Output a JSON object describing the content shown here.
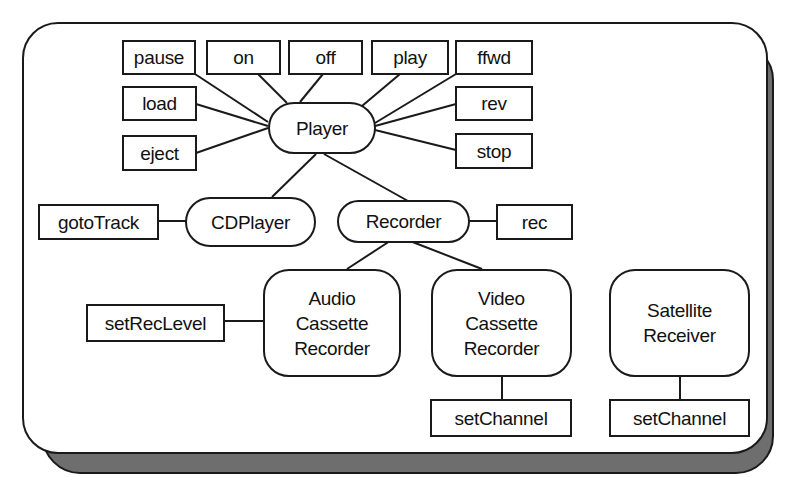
{
  "diagram": {
    "type": "class-hierarchy",
    "colors": {
      "stroke": "#1a1a1a",
      "shadow": "#6e6e6e",
      "background": "#ffffff"
    },
    "classes": {
      "player": "Player",
      "cdplayer": "CDPlayer",
      "recorder": "Recorder",
      "audio_cassette": "Audio\nCassette\nRecorder",
      "video_cassette": "Video\nCassette\nRecorder",
      "satellite": "Satellite\nReceiver"
    },
    "methods": {
      "pause": "pause",
      "on": "on",
      "off": "off",
      "play": "play",
      "ffwd": "ffwd",
      "load": "load",
      "rev": "rev",
      "eject": "eject",
      "stop": "stop",
      "gototrack": "gotoTrack",
      "rec": "rec",
      "setreclevel": "setRecLevel",
      "setchannel_vcr": "setChannel",
      "setchannel_sat": "setChannel"
    },
    "edges": [
      [
        "Player",
        "pause"
      ],
      [
        "Player",
        "on"
      ],
      [
        "Player",
        "off"
      ],
      [
        "Player",
        "play"
      ],
      [
        "Player",
        "ffwd"
      ],
      [
        "Player",
        "load"
      ],
      [
        "Player",
        "rev"
      ],
      [
        "Player",
        "eject"
      ],
      [
        "Player",
        "stop"
      ],
      [
        "Player",
        "CDPlayer"
      ],
      [
        "Player",
        "Recorder"
      ],
      [
        "CDPlayer",
        "gotoTrack"
      ],
      [
        "Recorder",
        "rec"
      ],
      [
        "Recorder",
        "Audio Cassette Recorder"
      ],
      [
        "Recorder",
        "Video Cassette Recorder"
      ],
      [
        "Audio Cassette Recorder",
        "setRecLevel"
      ],
      [
        "Video Cassette Recorder",
        "setChannel"
      ],
      [
        "Satellite Receiver",
        "setChannel"
      ]
    ]
  }
}
